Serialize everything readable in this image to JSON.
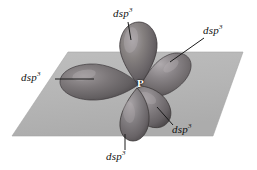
{
  "figure": {
    "background_color": "#ffffff",
    "plane": {
      "name": "equatorial-plane",
      "fill_color": "#b6b6b6",
      "points": "68,52 243,52 213,136 12,136"
    },
    "central_atom": {
      "symbol": "P",
      "label_color": "#ffffff",
      "x": 140,
      "y": 83
    },
    "orbital_color_dark": "#5d5a5c",
    "orbital_color_mid": "#777376",
    "orbital_color_light": "#9a9598",
    "leader_line_color": "#1a1a1a",
    "labels": [
      {
        "id": "label-top",
        "text": "dsp",
        "superscript": "3",
        "x": 113,
        "y": 8,
        "leader": "128,22 132,40"
      },
      {
        "id": "label-upper-right",
        "text": "dsp",
        "superscript": "3",
        "x": 205,
        "y": 26,
        "leader": "204,38 170,62"
      },
      {
        "id": "label-left",
        "text": "dsp",
        "superscript": "3",
        "x": 22,
        "y": 72,
        "leader": "55,79 92,79"
      },
      {
        "id": "label-lower-right",
        "text": "dsp",
        "superscript": "3",
        "x": 172,
        "y": 126,
        "leader": "173,126 158,110"
      },
      {
        "id": "label-bottom",
        "text": "dsp",
        "superscript": "3",
        "x": 106,
        "y": 152,
        "leader": "125,150 125,133"
      }
    ],
    "orbitals": [
      {
        "id": "lobe-top",
        "direction": "up"
      },
      {
        "id": "lobe-left",
        "direction": "left"
      },
      {
        "id": "lobe-upper-right",
        "direction": "upper-right"
      },
      {
        "id": "lobe-lower-right",
        "direction": "lower-right"
      },
      {
        "id": "lobe-bottom",
        "direction": "down"
      }
    ]
  }
}
